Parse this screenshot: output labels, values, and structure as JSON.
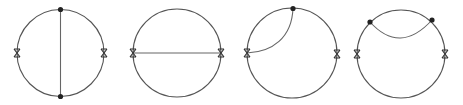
{
  "figure": {
    "colors": {
      "line": "#555555",
      "vertex": "#222222",
      "background": "#ffffff"
    },
    "diagrams": [
      {
        "id": "diagram-1",
        "label": "vertical chord",
        "center": [
          60,
          53
        ],
        "radius": 44,
        "crosses": [
          [
            17,
            53
          ],
          [
            104,
            53
          ]
        ],
        "dots": [
          [
            60,
            9
          ],
          [
            60,
            97
          ]
        ],
        "internal": "straight vertical line connecting top and bottom dots"
      },
      {
        "id": "diagram-2",
        "label": "horizontal chord",
        "center": [
          177,
          53
        ],
        "radius": 44,
        "crosses": [
          [
            133,
            53
          ],
          [
            221,
            53
          ]
        ],
        "dots": [],
        "internal": "straight horizontal line connecting the two crosses"
      },
      {
        "id": "diagram-3",
        "label": "arc from cross to top vertex",
        "center": [
          292,
          53
        ],
        "radius": 45,
        "crosses": [
          [
            247,
            53
          ],
          [
            337,
            53
          ]
        ],
        "dots": [
          [
            293,
            8
          ]
        ],
        "internal": "curved arc from left cross to top dot"
      },
      {
        "id": "diagram-4",
        "label": "top self-energy arc",
        "center": [
          401,
          54
        ],
        "radius": 44,
        "crosses": [
          [
            357,
            54
          ],
          [
            445,
            54
          ]
        ],
        "dots": [
          [
            370,
            22
          ],
          [
            432,
            20
          ]
        ],
        "internal": "curved arc sagging downward between the two upper dots"
      }
    ]
  }
}
